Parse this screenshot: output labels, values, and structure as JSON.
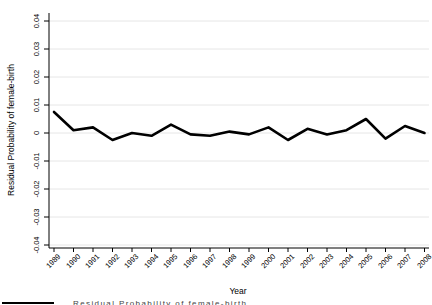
{
  "chart_data": {
    "type": "line",
    "title": "",
    "xlabel": "Year",
    "ylabel": "Residual Probability of female-birth",
    "x": [
      1989,
      1990,
      1991,
      1992,
      1993,
      1994,
      1995,
      1996,
      1997,
      1998,
      1999,
      2000,
      2001,
      2002,
      2003,
      2004,
      2005,
      2006,
      2007,
      2008
    ],
    "series": [
      {
        "name": "Residual Probability of female-birth",
        "values": [
          0.0075,
          0.001,
          0.002,
          -0.0025,
          0.0,
          -0.001,
          0.003,
          -0.0005,
          -0.001,
          0.0005,
          -0.0005,
          0.002,
          -0.0025,
          0.0015,
          -0.0005,
          0.001,
          0.005,
          -0.002,
          0.0025,
          0.0
        ]
      }
    ],
    "ylim": [
      -0.04,
      0.04
    ],
    "ytick_step": 0.01,
    "y_tick_labels": [
      "0.04",
      "0.03",
      "0.02",
      "0.01",
      "0",
      "-0.01",
      "-0.02",
      "-0.03",
      "-0.04"
    ],
    "y_tick_values": [
      0.04,
      0.03,
      0.02,
      0.01,
      0,
      -0.01,
      -0.02,
      -0.03,
      -0.04
    ],
    "x_tick_labels": [
      "1989",
      "1990",
      "1991",
      "1992",
      "1993",
      "1994",
      "1995",
      "1996",
      "1997",
      "1998",
      "1999",
      "2000",
      "2001",
      "2002",
      "2003",
      "2004",
      "2005",
      "2006",
      "2007",
      "2008"
    ],
    "grid": "horizontal",
    "legend_position": "bottom-clipped",
    "colors": {
      "line": "#000000",
      "grid": "#e6e6e6",
      "axis": "#000000",
      "background": "#ffffff",
      "text": "#000000"
    }
  },
  "axes": {
    "x_title": "Year",
    "y_title": "Residual Probability of female-birth"
  },
  "legend": {
    "label": "Residual Probability of female-birth"
  }
}
